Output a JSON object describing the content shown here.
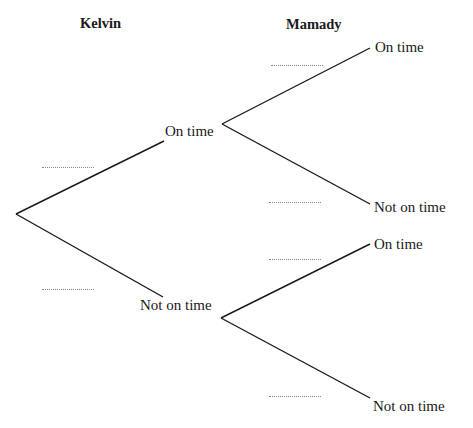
{
  "headers": {
    "first": "Kelvin",
    "second": "Mamady"
  },
  "first_stage": {
    "upper": "On time",
    "lower": "Not on time"
  },
  "second_stage": {
    "upper_upper": "On time",
    "upper_lower": "Not on time",
    "lower_upper": "On time",
    "lower_lower": "Not on time"
  },
  "probability_blanks": {
    "kelvin_on_time": "",
    "kelvin_not_on_time": "",
    "mamady_on_time_given_k_on": "",
    "mamady_not_on_time_given_k_on": "",
    "mamady_on_time_given_k_not": "",
    "mamady_not_on_time_given_k_not": ""
  },
  "colors": {
    "line": "#1a1a1a",
    "text": "#1a1a1a",
    "blank": "#8a8a8a"
  }
}
